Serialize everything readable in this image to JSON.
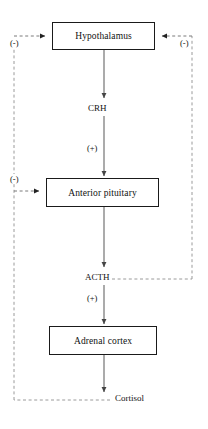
{
  "diagram": {
    "colors": {
      "background": "#ffffff",
      "stroke": "#1a1a1a",
      "solid_arrow": "#555555",
      "dashed_line": "#999999",
      "text": "#111111"
    },
    "nodes": [
      {
        "id": "hypothalamus",
        "label": "Hypothalamus"
      },
      {
        "id": "pituitary",
        "label": "Anterior pituitary"
      },
      {
        "id": "adrenal",
        "label": "Adrenal cortex"
      }
    ],
    "mediators": [
      {
        "id": "crh",
        "label": "CRH"
      },
      {
        "id": "acth",
        "label": "ACTH"
      },
      {
        "id": "cortisol",
        "label": "Cortisol"
      }
    ],
    "signs": {
      "plus_crh": "(+)",
      "plus_acth": "(+)",
      "minus_left_top": "(-)",
      "minus_left_mid": "(-)",
      "minus_right": "(-)"
    },
    "edges": [
      {
        "from": "hypothalamus",
        "to": "pituitary",
        "via": "CRH",
        "sign": "(+)",
        "style": "solid"
      },
      {
        "from": "pituitary",
        "to": "adrenal",
        "via": "ACTH",
        "sign": "(+)",
        "style": "solid"
      },
      {
        "from": "adrenal",
        "to": "Cortisol",
        "style": "solid"
      },
      {
        "from": "Cortisol",
        "to": "hypothalamus",
        "sign": "(-)",
        "style": "dashed"
      },
      {
        "from": "Cortisol",
        "to": "pituitary",
        "sign": "(-)",
        "style": "dashed"
      },
      {
        "from": "ACTH",
        "to": "hypothalamus",
        "sign": "(-)",
        "style": "dashed"
      }
    ]
  }
}
